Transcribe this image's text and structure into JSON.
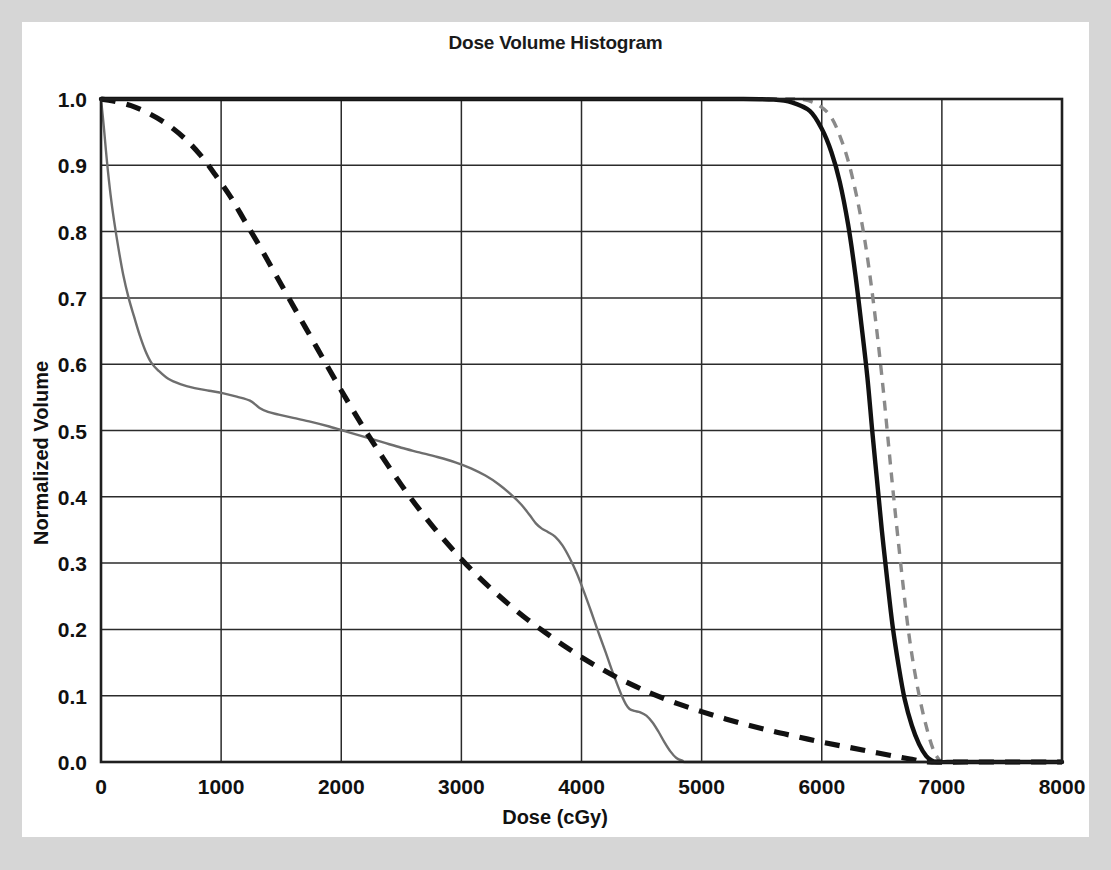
{
  "chart_data": {
    "type": "line",
    "title": "Dose Volume Histogram",
    "xlabel": "Dose (cGy)",
    "ylabel": "Normalized Volume",
    "xlim": [
      0,
      8000
    ],
    "ylim": [
      0.0,
      1.0
    ],
    "xticks": [
      0,
      1000,
      2000,
      3000,
      4000,
      5000,
      6000,
      7000,
      8000
    ],
    "xtick_labels": [
      "0",
      "1000",
      "2000",
      "3000",
      "4000",
      "5000",
      "6000",
      "7000",
      "8000"
    ],
    "yticks": [
      0.0,
      0.1,
      0.2,
      0.3,
      0.4,
      0.5,
      0.6,
      0.7,
      0.8,
      0.9,
      1.0
    ],
    "ytick_labels": [
      "0.0",
      "0.1",
      "0.2",
      "0.3",
      "0.4",
      "0.5",
      "0.6",
      "0.7",
      "0.8",
      "0.9",
      "1.0"
    ],
    "grid": true,
    "legend": "none",
    "series": [
      {
        "name": "target-solid-black",
        "style": "solid",
        "color": "#111111",
        "width": "thick",
        "points": [
          [
            0,
            1.0
          ],
          [
            1000,
            1.0
          ],
          [
            2000,
            1.0
          ],
          [
            3000,
            1.0
          ],
          [
            4000,
            1.0
          ],
          [
            4800,
            1.0
          ],
          [
            5300,
            1.0
          ],
          [
            5600,
            0.999
          ],
          [
            5750,
            0.995
          ],
          [
            5900,
            0.982
          ],
          [
            6000,
            0.955
          ],
          [
            6080,
            0.92
          ],
          [
            6150,
            0.875
          ],
          [
            6220,
            0.81
          ],
          [
            6280,
            0.735
          ],
          [
            6330,
            0.66
          ],
          [
            6380,
            0.58
          ],
          [
            6420,
            0.5
          ],
          [
            6460,
            0.425
          ],
          [
            6500,
            0.35
          ],
          [
            6545,
            0.275
          ],
          [
            6590,
            0.205
          ],
          [
            6640,
            0.145
          ],
          [
            6690,
            0.095
          ],
          [
            6750,
            0.055
          ],
          [
            6810,
            0.027
          ],
          [
            6870,
            0.009
          ],
          [
            6920,
            0.002
          ],
          [
            6960,
            0.0
          ],
          [
            7200,
            0.0
          ],
          [
            8000,
            0.0
          ]
        ]
      },
      {
        "name": "target-dashed-gray",
        "style": "dashed",
        "color": "#8a8a8a",
        "width": "thin",
        "points": [
          [
            0,
            1.0
          ],
          [
            2000,
            1.0
          ],
          [
            4000,
            1.0
          ],
          [
            5200,
            1.0
          ],
          [
            5650,
            1.0
          ],
          [
            5850,
            0.999
          ],
          [
            5980,
            0.99
          ],
          [
            6080,
            0.972
          ],
          [
            6160,
            0.94
          ],
          [
            6230,
            0.9
          ],
          [
            6300,
            0.845
          ],
          [
            6360,
            0.785
          ],
          [
            6415,
            0.715
          ],
          [
            6465,
            0.64
          ],
          [
            6510,
            0.565
          ],
          [
            6550,
            0.49
          ],
          [
            6590,
            0.415
          ],
          [
            6630,
            0.345
          ],
          [
            6675,
            0.27
          ],
          [
            6720,
            0.2
          ],
          [
            6770,
            0.14
          ],
          [
            6825,
            0.088
          ],
          [
            6880,
            0.047
          ],
          [
            6930,
            0.018
          ],
          [
            6975,
            0.004
          ],
          [
            7010,
            0.0
          ],
          [
            7400,
            0.0
          ],
          [
            8000,
            0.0
          ]
        ]
      },
      {
        "name": "organ-dashed-black",
        "style": "dashed",
        "color": "#111111",
        "width": "thick",
        "points": [
          [
            0,
            1.0
          ],
          [
            100,
            0.997
          ],
          [
            250,
            0.99
          ],
          [
            400,
            0.978
          ],
          [
            550,
            0.962
          ],
          [
            700,
            0.94
          ],
          [
            830,
            0.915
          ],
          [
            950,
            0.886
          ],
          [
            1080,
            0.852
          ],
          [
            1200,
            0.815
          ],
          [
            1330,
            0.775
          ],
          [
            1460,
            0.733
          ],
          [
            1600,
            0.688
          ],
          [
            1750,
            0.64
          ],
          [
            1900,
            0.592
          ],
          [
            2050,
            0.545
          ],
          [
            2200,
            0.5
          ],
          [
            2350,
            0.458
          ],
          [
            2500,
            0.418
          ],
          [
            2650,
            0.381
          ],
          [
            2800,
            0.347
          ],
          [
            2950,
            0.316
          ],
          [
            3100,
            0.287
          ],
          [
            3250,
            0.261
          ],
          [
            3400,
            0.237
          ],
          [
            3550,
            0.215
          ],
          [
            3700,
            0.195
          ],
          [
            3850,
            0.176
          ],
          [
            4000,
            0.158
          ],
          [
            4150,
            0.142
          ],
          [
            4300,
            0.127
          ],
          [
            4450,
            0.114
          ],
          [
            4600,
            0.102
          ],
          [
            4800,
            0.088
          ],
          [
            5000,
            0.076
          ],
          [
            5200,
            0.065
          ],
          [
            5400,
            0.055
          ],
          [
            5600,
            0.046
          ],
          [
            5800,
            0.038
          ],
          [
            6000,
            0.03
          ],
          [
            6200,
            0.023
          ],
          [
            6400,
            0.016
          ],
          [
            6600,
            0.009
          ],
          [
            6750,
            0.004
          ],
          [
            6880,
            0.0
          ],
          [
            7200,
            0.0
          ],
          [
            8000,
            0.0
          ]
        ]
      },
      {
        "name": "organ-solid-gray",
        "style": "solid",
        "color": "#6e6e6e",
        "width": "thin",
        "points": [
          [
            0,
            1.0
          ],
          [
            25,
            0.955
          ],
          [
            50,
            0.905
          ],
          [
            80,
            0.855
          ],
          [
            110,
            0.815
          ],
          [
            145,
            0.775
          ],
          [
            185,
            0.735
          ],
          [
            230,
            0.7
          ],
          [
            275,
            0.672
          ],
          [
            320,
            0.645
          ],
          [
            370,
            0.62
          ],
          [
            420,
            0.602
          ],
          [
            480,
            0.59
          ],
          [
            560,
            0.578
          ],
          [
            660,
            0.57
          ],
          [
            780,
            0.564
          ],
          [
            900,
            0.56
          ],
          [
            1020,
            0.556
          ],
          [
            1130,
            0.551
          ],
          [
            1240,
            0.545
          ],
          [
            1320,
            0.534
          ],
          [
            1390,
            0.528
          ],
          [
            1480,
            0.524
          ],
          [
            1600,
            0.519
          ],
          [
            1750,
            0.513
          ],
          [
            1900,
            0.506
          ],
          [
            2050,
            0.498
          ],
          [
            2200,
            0.49
          ],
          [
            2350,
            0.482
          ],
          [
            2500,
            0.474
          ],
          [
            2650,
            0.467
          ],
          [
            2800,
            0.46
          ],
          [
            2950,
            0.452
          ],
          [
            3080,
            0.443
          ],
          [
            3200,
            0.432
          ],
          [
            3310,
            0.419
          ],
          [
            3410,
            0.404
          ],
          [
            3500,
            0.388
          ],
          [
            3570,
            0.372
          ],
          [
            3620,
            0.36
          ],
          [
            3670,
            0.352
          ],
          [
            3720,
            0.347
          ],
          [
            3780,
            0.34
          ],
          [
            3840,
            0.327
          ],
          [
            3900,
            0.308
          ],
          [
            3960,
            0.285
          ],
          [
            4020,
            0.257
          ],
          [
            4080,
            0.227
          ],
          [
            4140,
            0.196
          ],
          [
            4200,
            0.166
          ],
          [
            4250,
            0.14
          ],
          [
            4300,
            0.116
          ],
          [
            4340,
            0.098
          ],
          [
            4370,
            0.087
          ],
          [
            4400,
            0.08
          ],
          [
            4440,
            0.077
          ],
          [
            4490,
            0.075
          ],
          [
            4540,
            0.07
          ],
          [
            4590,
            0.06
          ],
          [
            4640,
            0.046
          ],
          [
            4690,
            0.03
          ],
          [
            4740,
            0.016
          ],
          [
            4790,
            0.006
          ],
          [
            4840,
            0.002
          ],
          [
            4900,
            0.0
          ],
          [
            5500,
            0.0
          ],
          [
            6500,
            0.0
          ],
          [
            8000,
            0.0
          ]
        ]
      }
    ]
  },
  "colors": {
    "page_border": "#d6d6d6",
    "plot_background": "#ffffff",
    "axis": "#1f1f1f",
    "grid": "#2b2b2b",
    "solid_black": "#111111",
    "solid_gray": "#6e6e6e",
    "dashed_gray": "#8a8a8a"
  }
}
